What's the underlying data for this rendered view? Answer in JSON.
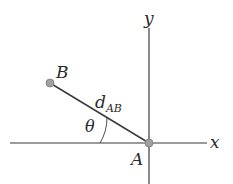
{
  "diagram": {
    "axes": {
      "x_label": "x",
      "y_label": "y",
      "color": "#3a3a3a"
    },
    "points": {
      "A": {
        "label": "A",
        "color": "#9a9a9a"
      },
      "B": {
        "label": "B",
        "color": "#9a9a9a"
      }
    },
    "segment": {
      "label_main": "d",
      "label_sub": "AB",
      "color": "#3a3a3a"
    },
    "angle": {
      "label": "θ"
    }
  }
}
